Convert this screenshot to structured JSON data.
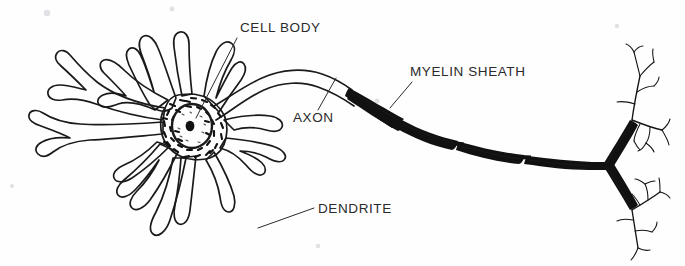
{
  "figure": {
    "kind": "line-drawing",
    "background_color": "#fefefe",
    "ink_color": "#111111",
    "label_color": "#2b2b2b"
  },
  "labels": [
    {
      "id": "cell-body",
      "text": "CELL BODY",
      "x": 240,
      "y": 32,
      "anchor": "start",
      "leader": {
        "x1": 237,
        "y1": 38,
        "x2": 196,
        "y2": 118
      }
    },
    {
      "id": "axon",
      "text": "AXON",
      "x": 293,
      "y": 122,
      "anchor": "start",
      "leader": {
        "x1": 318,
        "y1": 110,
        "x2": 336,
        "y2": 78
      }
    },
    {
      "id": "myelin-sheath",
      "text": "MYELIN SHEATH",
      "x": 410,
      "y": 76,
      "anchor": "start",
      "leader": {
        "x1": 412,
        "y1": 82,
        "x2": 390,
        "y2": 108
      }
    },
    {
      "id": "dendrite",
      "text": "DENDRITE",
      "x": 318,
      "y": 213,
      "anchor": "start",
      "leader": {
        "x1": 314,
        "y1": 208,
        "x2": 258,
        "y2": 228
      }
    }
  ],
  "parts": {
    "soma": {
      "name": "cell body",
      "center_x": 196,
      "center_y": 128
    },
    "nucleus": {
      "name": "nucleus",
      "center_x": 192,
      "center_y": 126,
      "rx": 20,
      "ry": 22
    },
    "nucleolus": {
      "name": "nucleolus",
      "center_x": 190,
      "center_y": 126,
      "rx": 4.4,
      "ry": 5.2
    },
    "axon": {
      "name": "axon",
      "start_x": 232,
      "start_y": 112,
      "end_x": 605,
      "end_y": 140
    },
    "myelin": {
      "name": "myelin sheath",
      "segment_count": 5
    },
    "terminal_fork": {
      "name": "axon terminal fork",
      "x": 605,
      "y": 140
    },
    "dendrite_count": 13
  }
}
